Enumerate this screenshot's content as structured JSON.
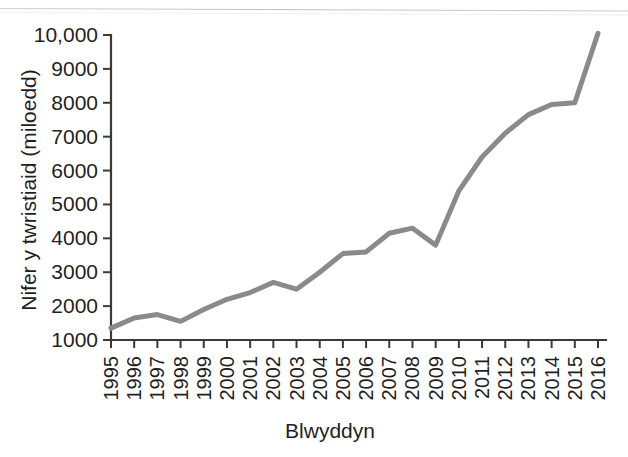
{
  "figure": {
    "background_color": "#ffffff",
    "line_color": "#8a8a8a",
    "axis_color": "#3a3a3a",
    "text_color": "#1f1f1f"
  },
  "chart_data": {
    "type": "line",
    "title": "",
    "subtitle": "",
    "xlabel": "Blwyddyn",
    "ylabel": "Nifer y twristiaid (miloedd)",
    "categories": [
      "1995",
      "1996",
      "1997",
      "1998",
      "1999",
      "2000",
      "2001",
      "2002",
      "2003",
      "2004",
      "2005",
      "2006",
      "2007",
      "2008",
      "2009",
      "2010",
      "2011",
      "2012",
      "2013",
      "2014",
      "2015",
      "2016"
    ],
    "values": [
      1350,
      1650,
      1750,
      1550,
      1900,
      2200,
      2400,
      2700,
      2500,
      3000,
      3550,
      3600,
      4150,
      4300,
      3800,
      5400,
      6400,
      7100,
      7650,
      7950,
      8000,
      10050
    ],
    "series": [
      {
        "name": "Nifer y twristiaid",
        "color": "#8a8a8a",
        "values": [
          1350,
          1650,
          1750,
          1550,
          1900,
          2200,
          2400,
          2700,
          2500,
          3000,
          3550,
          3600,
          4150,
          4300,
          3800,
          5400,
          6400,
          7100,
          7650,
          7950,
          8000,
          10050
        ]
      }
    ],
    "ylim": [
      1000,
      10000
    ],
    "ytick_labels": [
      "1000",
      "2000",
      "3000",
      "4000",
      "5000",
      "6000",
      "7000",
      "8000",
      "9000",
      "10,000"
    ],
    "ytick_values": [
      1000,
      2000,
      3000,
      4000,
      5000,
      6000,
      7000,
      8000,
      9000,
      10000
    ],
    "xtick_rotation": -90,
    "grid": false,
    "legend": false,
    "legend_position": "none",
    "markers": false
  }
}
